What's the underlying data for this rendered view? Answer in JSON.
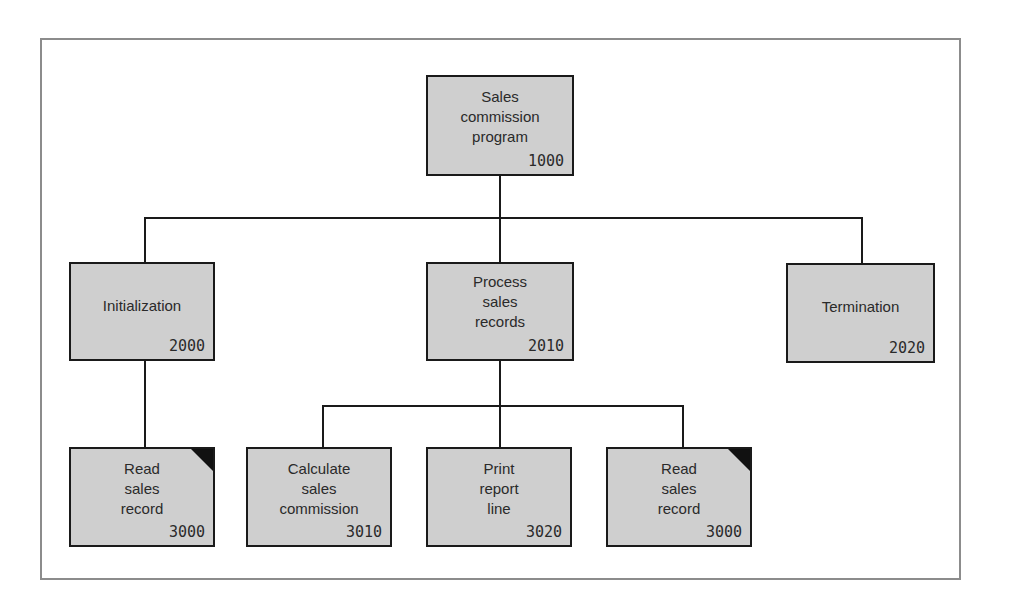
{
  "diagram": {
    "type": "hierarchy-chart",
    "frame_color": "#8c8c8c",
    "box_fill": "#cfcfcf",
    "line_color": "#1a1a1a",
    "nodes": {
      "root": {
        "label": "Sales\ncommission\nprogram",
        "code": "1000",
        "corner_marker": false
      },
      "init": {
        "label": "Initialization",
        "code": "2000",
        "corner_marker": false
      },
      "process": {
        "label": "Process\nsales\nrecords",
        "code": "2010",
        "corner_marker": false
      },
      "term": {
        "label": "Termination",
        "code": "2020",
        "corner_marker": false
      },
      "read1": {
        "label": "Read\nsales\nrecord",
        "code": "3000",
        "corner_marker": true
      },
      "calc": {
        "label": "Calculate\nsales\ncommission",
        "code": "3010",
        "corner_marker": false
      },
      "print": {
        "label": "Print\nreport\nline",
        "code": "3020",
        "corner_marker": false
      },
      "read2": {
        "label": "Read\nsales\nrecord",
        "code": "3000",
        "corner_marker": true
      }
    },
    "edges": [
      [
        "root",
        "init"
      ],
      [
        "root",
        "process"
      ],
      [
        "root",
        "term"
      ],
      [
        "init",
        "read1"
      ],
      [
        "process",
        "calc"
      ],
      [
        "process",
        "print"
      ],
      [
        "process",
        "read2"
      ]
    ]
  }
}
